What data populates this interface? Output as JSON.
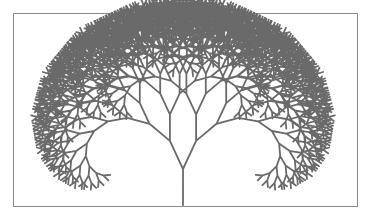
{
  "figure": {
    "colors": {
      "branch": "#6a6a6a",
      "border": "#8c8c8c",
      "background": "#ffffff"
    },
    "tree": {
      "origin": [
        183,
        205
      ],
      "trunk_length": 36,
      "length_ratio": 0.86,
      "branch_angle_deg": 25,
      "depth": 11,
      "stroke_width": 1.8,
      "scale_x": 1.0,
      "scale_y": 1.0
    }
  }
}
